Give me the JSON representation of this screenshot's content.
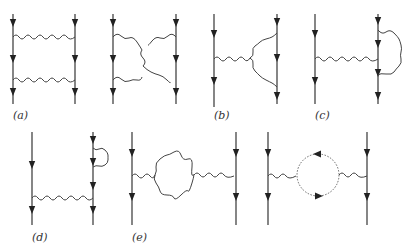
{
  "figure": {
    "labels": {
      "a": "(a)",
      "b": "(b)",
      "c": "(c)",
      "d": "(d)",
      "e": "(e)"
    },
    "diagrams": [
      {
        "id": "a",
        "label": "(a)",
        "type": "ladder-box",
        "fermion_lines": 2,
        "photon_lines": 2
      },
      {
        "id": "a-crossed",
        "label": "",
        "type": "crossed-box",
        "fermion_lines": 2,
        "photon_lines": 2
      },
      {
        "id": "b",
        "label": "(b)",
        "type": "vertex-correction",
        "fermion_lines": 2
      },
      {
        "id": "c",
        "label": "(c)",
        "type": "vertex-correction-fermion-loop",
        "fermion_lines": 2
      },
      {
        "id": "d",
        "label": "(d)",
        "type": "self-energy",
        "fermion_lines": 2
      },
      {
        "id": "e",
        "label": "(e)",
        "type": "photon-loop-polarization",
        "fermion_lines": 2
      },
      {
        "id": "e2",
        "label": "",
        "type": "vacuum-polarization-dotted-loop",
        "fermion_lines": 2
      }
    ],
    "colors": {
      "line": "#444444",
      "background": "#ffffff"
    }
  }
}
